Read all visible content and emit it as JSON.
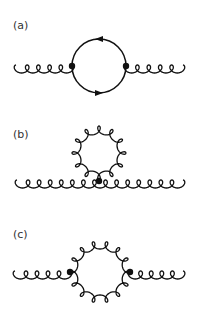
{
  "colors": {
    "stroke": "#111111",
    "background": "#ffffff",
    "label": "#333333"
  },
  "panels": [
    {
      "id": "a",
      "label": "(a)",
      "label_pos": [
        13,
        20
      ],
      "description": "Gluon self-energy with a quark (fermion) loop",
      "loop": {
        "type": "fermion",
        "cx": 99,
        "cy": 66,
        "r": 27,
        "arrows": [
          "top-left",
          "bottom-right"
        ]
      },
      "vertices": [
        [
          72,
          66
        ],
        [
          126,
          66
        ]
      ],
      "external_gluons": [
        {
          "x1": 16,
          "y": 66,
          "x2": 72,
          "loops": 5
        },
        {
          "x1": 126,
          "y": 66,
          "x2": 183,
          "loops": 5
        }
      ]
    },
    {
      "id": "b",
      "label": "(b)",
      "label_pos": [
        13,
        129
      ],
      "description": "Gluon tadpole: four-gluon vertex with gluon loop",
      "loop": {
        "type": "gluon",
        "cx": 99,
        "cy": 153,
        "r": 27,
        "loops": 12
      },
      "vertices": [
        [
          99,
          181
        ]
      ],
      "external_gluons": [
        {
          "x1": 17,
          "y": 181,
          "x2": 183,
          "loops": 15
        }
      ]
    },
    {
      "id": "c",
      "label": "(c)",
      "label_pos": [
        13,
        229
      ],
      "description": "Gluon self-energy with a gluon loop",
      "loop": {
        "type": "gluon",
        "cx": 100,
        "cy": 272,
        "r": 31,
        "loops": 14
      },
      "vertices": [
        [
          70,
          272
        ],
        [
          130,
          272
        ]
      ],
      "external_gluons": [
        {
          "x1": 15,
          "y": 272,
          "x2": 70,
          "loops": 5
        },
        {
          "x1": 130,
          "y": 272,
          "x2": 183,
          "loops": 5
        }
      ]
    }
  ]
}
